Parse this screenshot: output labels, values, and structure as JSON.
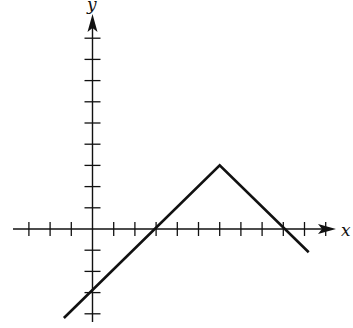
{
  "diagram": {
    "type": "piecewise-linear-graph",
    "x_axis_label": "x",
    "y_axis_label": "y",
    "unit_px": 21.2,
    "origin_px": [
      92.5,
      229
    ],
    "x_ticks": [
      -3,
      -2,
      -1,
      1,
      2,
      3,
      4,
      5,
      6,
      7,
      8,
      9,
      10,
      11
    ],
    "y_ticks": [
      -4,
      -3,
      -2,
      -1,
      1,
      2,
      3,
      4,
      5,
      6,
      7,
      8,
      9
    ],
    "graph_points": [
      [
        -1.35,
        -4.2
      ],
      [
        6,
        3
      ],
      [
        10.2,
        -1.1
      ]
    ],
    "key_points": {
      "y_intercept": [
        0,
        -3
      ],
      "x_intercepts": [
        [
          3,
          0
        ],
        [
          9,
          0
        ]
      ],
      "vertex": [
        6,
        3
      ]
    },
    "line_color": "#111111"
  }
}
